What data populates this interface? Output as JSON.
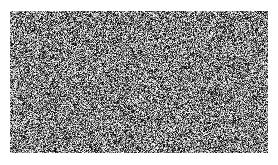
{
  "canvas": {
    "width": 278,
    "height": 165,
    "background_color": "#ffffff"
  },
  "figure": {
    "name": "random-noise-patch",
    "caption": "",
    "title": ""
  },
  "noise_block": {
    "x": 10,
    "y": 11,
    "width": 258,
    "height": 142,
    "grain_size_px": 1,
    "color_mode": "grayscale",
    "mean_gray": "#808080",
    "min_gray": "#000000",
    "max_gray": "#ffffff",
    "distribution": "uniform",
    "border": "none",
    "seed": 20240517
  },
  "margins": {
    "left": 10,
    "right": 10,
    "top": 11,
    "bottom": 12
  }
}
